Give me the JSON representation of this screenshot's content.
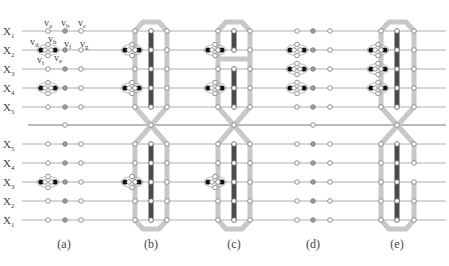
{
  "figure": {
    "row_labels_top": [
      "X",
      "X",
      "X",
      "X",
      "X"
    ],
    "row_label_subs_top": [
      "1",
      "2",
      "3",
      "4",
      "5"
    ],
    "row_labels_bottom": [
      "X",
      "X",
      "X",
      "X",
      "X"
    ],
    "row_label_subs_bottom": [
      "5",
      "4",
      "3",
      "2",
      "1"
    ],
    "vertex_labels": [
      {
        "base": "v",
        "sub": "a"
      },
      {
        "base": "v",
        "sub": "b"
      },
      {
        "base": "v",
        "sub": "c"
      },
      {
        "base": "v",
        "sub": "d"
      },
      {
        "base": "v",
        "sub": "h"
      },
      {
        "base": "v",
        "sub": "f"
      },
      {
        "base": "v",
        "sub": "g"
      },
      {
        "base": "v",
        "sub": "i"
      },
      {
        "base": "v",
        "sub": "e"
      }
    ],
    "panels": [
      {
        "id": "a",
        "caption": "(a)"
      },
      {
        "id": "b",
        "caption": "(b)"
      },
      {
        "id": "c",
        "caption": "(c)"
      },
      {
        "id": "d",
        "caption": "(d)"
      },
      {
        "id": "e",
        "caption": "(e)"
      }
    ],
    "colors": {
      "line": "#9a9a9a",
      "loop": "#c8c8c8",
      "bar": "#4a4a4a",
      "node_fill_open": "#ffffff",
      "node_fill_grey": "#9a9a9a",
      "node_black": "#111111"
    }
  }
}
